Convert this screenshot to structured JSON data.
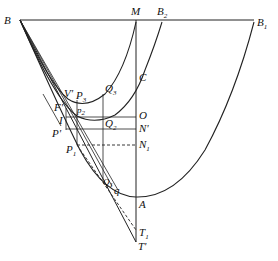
{
  "diagram": {
    "type": "geometric construction (parabolic curves, tangents, vertical axis)",
    "colors": {
      "stroke": "#222222",
      "background": "#ffffff"
    },
    "points": [
      {
        "id": "B",
        "label": "B",
        "sub": "",
        "x": 20,
        "y": 20
      },
      {
        "id": "M",
        "label": "M",
        "sub": "",
        "x": 136,
        "y": 20
      },
      {
        "id": "B2",
        "label": "B",
        "sub": "2",
        "x": 162,
        "y": 20
      },
      {
        "id": "B1",
        "label": "B",
        "sub": "1",
        "x": 255,
        "y": 20
      },
      {
        "id": "C",
        "label": "C",
        "sub": "",
        "x": 136,
        "y": 77
      },
      {
        "id": "Q3",
        "label": "Q",
        "sub": "3",
        "x": 103,
        "y": 95
      },
      {
        "id": "V'",
        "label": "V'",
        "sub": "",
        "x": 68,
        "y": 100
      },
      {
        "id": "P3",
        "label": "P",
        "sub": "3",
        "x": 78,
        "y": 100
      },
      {
        "id": "F'",
        "label": "F'",
        "sub": "",
        "x": 65,
        "y": 111
      },
      {
        "id": "P2",
        "label": "P",
        "sub": "2",
        "x": 77,
        "y": 117
      },
      {
        "id": "O",
        "label": "O",
        "sub": "",
        "x": 136,
        "y": 117
      },
      {
        "id": "Q2",
        "label": "Q",
        "sub": "2",
        "x": 103,
        "y": 117
      },
      {
        "id": "I",
        "label": "I",
        "sub": "",
        "x": 65,
        "y": 122
      },
      {
        "id": "N'",
        "label": "N'",
        "sub": "",
        "x": 136,
        "y": 129
      },
      {
        "id": "P'",
        "label": "P'",
        "sub": "",
        "x": 64,
        "y": 133
      },
      {
        "id": "P1",
        "label": "P",
        "sub": "1",
        "x": 77,
        "y": 145
      },
      {
        "id": "N1",
        "label": "N",
        "sub": "1",
        "x": 136,
        "y": 145
      },
      {
        "id": "Q1",
        "label": "Q",
        "sub": "1",
        "x": 112,
        "y": 184
      },
      {
        "id": "q",
        "label": "q",
        "sub": "",
        "x": 118,
        "y": 192
      },
      {
        "id": "A",
        "label": "A",
        "sub": "",
        "x": 136,
        "y": 197
      },
      {
        "id": "T1",
        "label": "T",
        "sub": "1",
        "x": 136,
        "y": 230
      },
      {
        "id": "T'",
        "label": "T'",
        "sub": "",
        "x": 136,
        "y": 242
      }
    ],
    "labels": {
      "B": "B",
      "M": "M",
      "B2": "B",
      "B2_sub": "2",
      "B1": "B",
      "B1_sub": "1",
      "C": "C",
      "O": "O",
      "N_prime": "N'",
      "N1": "N",
      "N1_sub": "1",
      "A": "A",
      "T1": "T",
      "T1_sub": "1",
      "T_prime": "T'",
      "V_prime": "V'",
      "P3": "P",
      "P3_sub": "3",
      "Q3": "Q",
      "Q3_sub": "3",
      "F_prime": "F'",
      "P2": "p",
      "P2_sub": "2",
      "Q2": "Q",
      "Q2_sub": "2",
      "I": "I",
      "P_prime": "P'",
      "P1": "P",
      "P1_sub": "1",
      "Q1": "Q",
      "Q1_sub": "1",
      "q": "q"
    },
    "segments": [
      {
        "name": "top-line-B-B1",
        "from": "B",
        "to": "B1",
        "style": "solid"
      },
      {
        "name": "axis-M-T'",
        "from": "M",
        "to": "T'",
        "style": "solid"
      },
      {
        "name": "vertical-Q3-Q1",
        "from": "Q3",
        "to": "Q1",
        "style": "solid"
      },
      {
        "name": "vertical-P3-P1",
        "from": "P3",
        "to": "P1",
        "style": "solid"
      },
      {
        "name": "horizontal-I-O",
        "from": "I",
        "to": "O",
        "style": "solid"
      },
      {
        "name": "horizontal-P'-N'",
        "from": "P'",
        "to": "N'",
        "style": "solid"
      },
      {
        "name": "horizontal-P1-N1",
        "from": "P1",
        "to": "N1",
        "style": "dashed"
      },
      {
        "name": "tangent-B-T'",
        "from": "B",
        "to": "T'",
        "style": "solid"
      },
      {
        "name": "tangent-P1-T1",
        "from": "P1",
        "to": "T1",
        "style": "dashed"
      }
    ],
    "curves": [
      {
        "name": "parabola-B-A-B1",
        "through": [
          "B",
          "P1",
          "q",
          "A",
          "B1"
        ]
      },
      {
        "name": "parabola-B-P2-C",
        "through": [
          "B",
          "P2",
          "Q2",
          "C",
          "B2"
        ]
      },
      {
        "name": "parabola-B-V'-M",
        "through": [
          "B",
          "V'",
          "Q3",
          "M"
        ]
      }
    ]
  }
}
